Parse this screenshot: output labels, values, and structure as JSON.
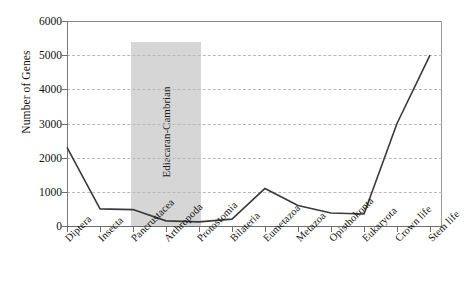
{
  "chart_data": {
    "type": "line",
    "title": "",
    "xlabel": "",
    "ylabel": "Number of Genes",
    "ylim": [
      0,
      6000
    ],
    "ytick_step": 1000,
    "yticks": [
      "0",
      "1000",
      "2000",
      "3000",
      "4000",
      "5000",
      "6000"
    ],
    "grid": true,
    "legend": "none",
    "categories": [
      "Diptera",
      "Insecta",
      "Pancrustacea",
      "Arthropoda",
      "Protostomia",
      "Bilateria",
      "Eumetazoa",
      "Metazoa",
      "Opisthokonta",
      "Eukaryota",
      "Crown life",
      "Stem life"
    ],
    "values": [
      2300,
      500,
      480,
      150,
      120,
      200,
      1100,
      600,
      380,
      350,
      3000,
      5000
    ],
    "series": [
      {
        "name": "Number of Genes",
        "values": [
          2300,
          500,
          480,
          150,
          120,
          200,
          1100,
          600,
          380,
          350,
          3000,
          5000
        ],
        "color": "#3a3a3a"
      }
    ],
    "annotations": [
      {
        "type": "shaded-band",
        "label": "Ediacaran-Cambrian",
        "x_start_category": "Pancrustacea",
        "x_end_category": "Protostomia",
        "y_top": 5400,
        "y_bottom": 0,
        "color": "#d6d6d6"
      }
    ],
    "colors": {
      "line": "#3a3a3a",
      "band": "#d6d6d6",
      "grid": "#b9b9b9",
      "axis": "#6e6e6e",
      "text": "#111111",
      "background": "#ffffff"
    }
  }
}
